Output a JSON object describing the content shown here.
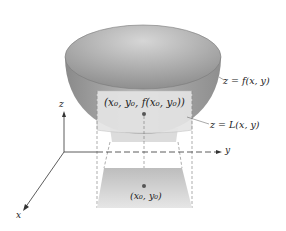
{
  "figure": {
    "labels": {
      "surface": "z = f(x, y)",
      "tangent_plane": "z = L(x, y)",
      "point_on_surface": "(x₀, y₀, f(x₀, y₀))",
      "point_in_domain": "(x₀, y₀)"
    },
    "axes": {
      "x": "x",
      "y": "y",
      "z": "z"
    },
    "colors": {
      "bowl_outer": "#9a9a9a",
      "bowl_inner": "#b8b8b8",
      "plane": "#e2e2e2",
      "projection": "#cfcfcf",
      "dot": "#555555",
      "axis": "#333333"
    }
  }
}
